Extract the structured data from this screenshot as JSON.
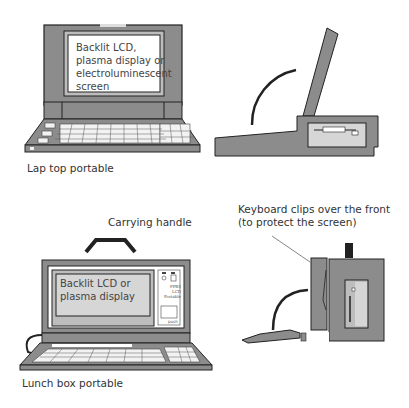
{
  "figure": {
    "laptop": {
      "caption": "Lap top portable",
      "screen_text": [
        "Backlit  LCD,",
        "plasma display or",
        "electroluminescent",
        "screen"
      ]
    },
    "lunchbox": {
      "caption": "Lunch box portable",
      "handle_label": "Carrying  handle",
      "screen_text": [
        "Backlit  LCD or",
        "plasma display"
      ],
      "side_panel_text": [
        "PPBS",
        "LCD",
        "Portable"
      ],
      "side_panel_small": "push"
    },
    "side_view_note": {
      "line1": "Keyboard clips over the front",
      "line2": "(to protect the screen)"
    },
    "colors": {
      "case": "#8c8c8c",
      "screen": "#d6d6d6",
      "outline": "#222222",
      "key": "#f2f2f2"
    }
  }
}
